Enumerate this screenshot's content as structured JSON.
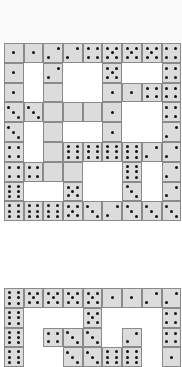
{
  "puzzle": {
    "title": "Domino grid puzzle",
    "colors": {
      "tile": "#dcdcdc",
      "border": "#8a8a8a",
      "pip": "#111111",
      "background": "#ffffff"
    },
    "grids": [
      {
        "name": "top-grid",
        "left": 4,
        "top": 43,
        "cell_w": 19.7,
        "cell_h": 19.8,
        "rows": [
          [
            1,
            1,
            2,
            2,
            4,
            5,
            5,
            5,
            4
          ],
          [
            1,
            null,
            2,
            null,
            null,
            5,
            null,
            null,
            4
          ],
          [
            1,
            null,
            0,
            null,
            null,
            1,
            1,
            4,
            4
          ],
          [
            3,
            3,
            0,
            0,
            0,
            1,
            null,
            null,
            4
          ],
          [
            3,
            null,
            0,
            null,
            null,
            1,
            null,
            null,
            2
          ],
          [
            4,
            null,
            0,
            6,
            6,
            6,
            6,
            2,
            2
          ],
          [
            4,
            4,
            0,
            0,
            null,
            null,
            6,
            null,
            2
          ],
          [
            6,
            null,
            null,
            5,
            null,
            null,
            3,
            null,
            2
          ],
          [
            6,
            6,
            6,
            5,
            3,
            2,
            3,
            3,
            3
          ]
        ]
      },
      {
        "name": "bottom-grid",
        "left": 4,
        "top": 288,
        "cell_w": 19.7,
        "cell_h": 19.8,
        "rows": [
          [
            6,
            5,
            5,
            5,
            5,
            1,
            1,
            2,
            2
          ],
          [
            6,
            null,
            null,
            null,
            5,
            null,
            null,
            null,
            4
          ],
          [
            6,
            null,
            4,
            3,
            3,
            null,
            2,
            null,
            4
          ],
          [
            6,
            null,
            null,
            3,
            3,
            6,
            6,
            null,
            1
          ]
        ]
      }
    ]
  }
}
